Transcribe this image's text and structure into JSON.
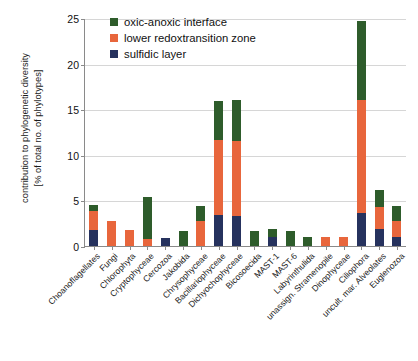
{
  "chart_data": {
    "type": "bar",
    "stacked": true,
    "title": "",
    "xlabel": "",
    "ylabel": "contribution to phylogenetic diversity [% of total no. of phylotypes]",
    "ylabel_line1": "contribution to phylogenetic diversity",
    "ylabel_line2": "[% of total no. of phylotypes]",
    "ylim": [
      0,
      25
    ],
    "yticks": [
      0,
      5,
      10,
      15,
      20,
      25
    ],
    "ytick_labels": [
      "0",
      "5",
      "10",
      "15",
      "20",
      "25"
    ],
    "grid": true,
    "grid_axis": "y",
    "legend_position": "top-left-inside",
    "categories": [
      "Choanoflagellates",
      "Fungi",
      "Chlorophyta",
      "Cryptophyceae",
      "Cercozoa",
      "Jakobida",
      "Chrysophyceae",
      "Bacillariophyceae",
      "Dichyochophyceae",
      "Bicosoecida",
      "MAST-1",
      "MAST-6",
      "Labyrinthulida",
      "unassign. Stramenopile",
      "Dinophyceae",
      "Ciliophora",
      "uncult. mar. Alveolates",
      "Euglenozoa"
    ],
    "series": [
      {
        "name": "sulfidic layer",
        "color": "#26325e",
        "values": [
          1.8,
          0.0,
          0.0,
          0.0,
          0.9,
          0.0,
          0.0,
          3.4,
          3.3,
          0.0,
          1.0,
          0.0,
          0.0,
          0.0,
          0.0,
          3.6,
          1.9,
          1.0
        ]
      },
      {
        "name": "lower redoxtransition zone",
        "color": "#e8663c",
        "values": [
          2.0,
          2.7,
          1.8,
          0.8,
          0.0,
          0.0,
          2.7,
          8.2,
          8.2,
          0.0,
          0.0,
          0.0,
          0.0,
          1.0,
          1.0,
          12.4,
          2.4,
          1.7
        ]
      },
      {
        "name": "oxic-anoxic interface",
        "color": "#2e5c2b",
        "values": [
          0.7,
          0.0,
          0.0,
          4.6,
          0.0,
          1.7,
          1.7,
          4.3,
          4.5,
          1.7,
          0.9,
          1.7,
          1.0,
          0.0,
          0.0,
          8.7,
          1.9,
          1.7
        ]
      }
    ],
    "totals": [
      4.5,
      2.7,
      1.8,
      5.4,
      0.9,
      1.7,
      4.4,
      15.9,
      16.0,
      1.7,
      1.9,
      1.7,
      1.0,
      1.0,
      1.0,
      24.7,
      6.2,
      4.4
    ]
  },
  "legend": {
    "items": [
      {
        "label": "oxic-anoxic interface",
        "color": "#2e5c2b"
      },
      {
        "label": "lower redoxtransition zone",
        "color": "#e8663c"
      },
      {
        "label": "sulfidic layer",
        "color": "#26325e"
      }
    ]
  }
}
